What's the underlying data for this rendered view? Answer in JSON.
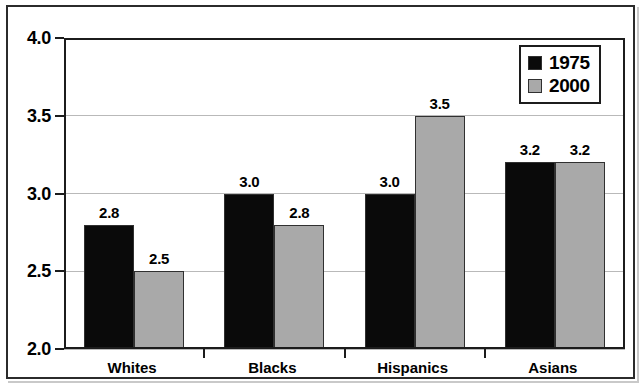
{
  "chart_data": {
    "type": "bar",
    "title": "",
    "subtitle": "",
    "xlabel": "",
    "ylabel": "",
    "categories": [
      "Whites",
      "Blacks",
      "Hispanics",
      "Asians"
    ],
    "series": [
      {
        "name": "1975",
        "color": "#0a0a0a",
        "values": [
          2.8,
          3.0,
          3.0,
          3.2
        ]
      },
      {
        "name": "2000",
        "color": "#a9a9a9",
        "values": [
          2.5,
          2.8,
          3.5,
          3.2
        ]
      }
    ],
    "value_labels": [
      [
        "2.8",
        "2.5"
      ],
      [
        "3.0",
        "2.8"
      ],
      [
        "3.0",
        "3.5"
      ],
      [
        "3.2",
        "3.2"
      ]
    ],
    "ylim": [
      2.0,
      4.0
    ],
    "yticks": [
      2.0,
      2.5,
      3.0,
      3.5,
      4.0
    ],
    "ytick_labels": [
      "2.0",
      "2.5",
      "3.0",
      "3.5",
      "4.0"
    ],
    "grid": true,
    "legend_position": "top-right"
  },
  "legend": {
    "entries": [
      {
        "label": "1975",
        "swatch": "black-square-icon"
      },
      {
        "label": "2000",
        "swatch": "gray-square-icon"
      }
    ]
  }
}
